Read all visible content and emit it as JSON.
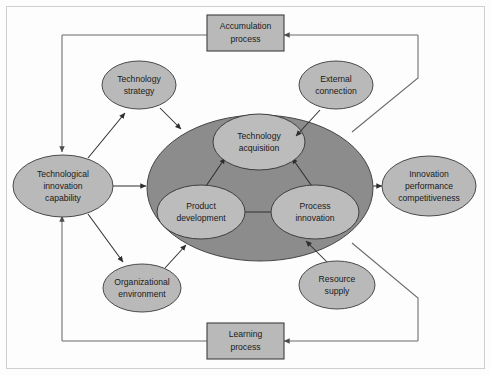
{
  "figure": {
    "colors": {
      "core_ellipse": "#8c8c8c",
      "node_ellipse": "#b9b9b9",
      "process_box": "#b9b9b9",
      "connector": "#2e2e2e",
      "feedback_loop": "#6a6a6a",
      "frame": "#cfcfcf",
      "text": "#1a1a1a"
    }
  },
  "nodes": {
    "technological_innovation_capability": {
      "line1": "Technological",
      "line2": "innovation",
      "line3": "capability"
    },
    "innovation_performance": {
      "line1": "Innovation",
      "line2": "performance",
      "line3": "competitiveness"
    },
    "technology_strategy": {
      "line1": "Technology",
      "line2": "strategy"
    },
    "external_connection": {
      "line1": "External",
      "line2": "connection"
    },
    "organizational_environment": {
      "line1": "Organizational",
      "line2": "environment"
    },
    "resource_supply": {
      "line1": "Resource",
      "line2": "supply"
    },
    "technology_acquisition": {
      "line1": "Technology",
      "line2": "acquisition"
    },
    "product_development": {
      "line1": "Product",
      "line2": "development"
    },
    "process_innovation": {
      "line1": "Process",
      "line2": "innovation"
    }
  },
  "process_boxes": {
    "accumulation": {
      "line1": "Accumulation",
      "line2": "process"
    },
    "learning": {
      "line1": "Learning",
      "line2": "process"
    }
  }
}
